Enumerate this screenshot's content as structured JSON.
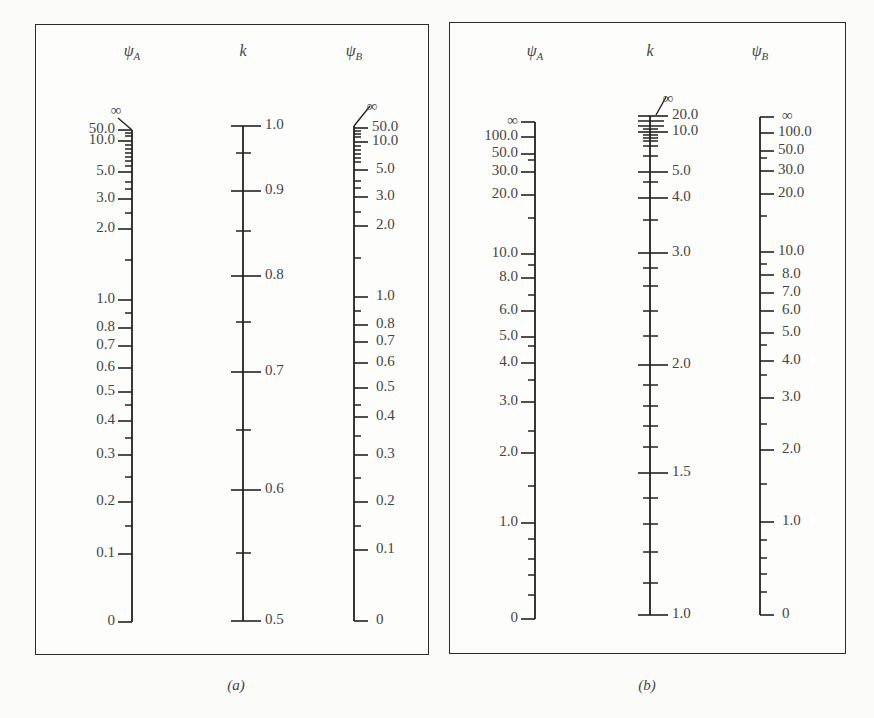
{
  "captions": {
    "a": "(a)",
    "b": "(b)"
  },
  "chart_data": [
    {
      "type": "nomograph",
      "title": "(a)",
      "axes": [
        {
          "name": "psi_A",
          "label": "ψ",
          "subscript": "A",
          "x": 132,
          "tick_side": "left",
          "label_side": "left",
          "top": 130,
          "bottom": 622,
          "infinity": {
            "label": "∞",
            "label_x": 116,
            "label_y": 112,
            "line": [
              118,
              118,
              132,
              130
            ]
          },
          "major": [
            {
              "v": "50.0",
              "y": 130
            },
            {
              "v": "10.0",
              "y": 141
            },
            {
              "v": "5.0",
              "y": 172
            },
            {
              "v": "3.0",
              "y": 199
            },
            {
              "v": "2.0",
              "y": 229
            },
            {
              "v": "1.0",
              "y": 300
            },
            {
              "v": "0.8",
              "y": 328
            },
            {
              "v": "0.7",
              "y": 346
            },
            {
              "v": "0.6",
              "y": 368
            },
            {
              "v": "0.5",
              "y": 392
            },
            {
              "v": "0.4",
              "y": 421
            },
            {
              "v": "0.3",
              "y": 455
            },
            {
              "v": "0.2",
              "y": 502
            },
            {
              "v": "0.1",
              "y": 554
            },
            {
              "v": "0",
              "y": 622
            }
          ],
          "minor": [
            133,
            136,
            145,
            149,
            153,
            157,
            161,
            166,
            182,
            189,
            213,
            260,
            313,
            405,
            438,
            477,
            526
          ]
        },
        {
          "name": "k",
          "label": "k",
          "subscript": "",
          "x": 243,
          "tick_side": "both",
          "label_side": "right",
          "top": 126,
          "bottom": 621,
          "major": [
            {
              "v": "1.0",
              "y": 126
            },
            {
              "v": "0.9",
              "y": 191
            },
            {
              "v": "0.8",
              "y": 276
            },
            {
              "v": "0.7",
              "y": 372
            },
            {
              "v": "0.6",
              "y": 490
            },
            {
              "v": "0.5",
              "y": 621
            }
          ],
          "minor": [
            153,
            231,
            322,
            430,
            553
          ]
        },
        {
          "name": "psi_B",
          "label": "ψ",
          "subscript": "B",
          "x": 354,
          "tick_side": "right",
          "label_side": "right",
          "top": 126,
          "bottom": 621,
          "infinity": {
            "label": "∞",
            "label_x": 372,
            "label_y": 108,
            "line": [
              370,
              106,
              354,
              126
            ]
          },
          "major": [
            {
              "v": "50.0",
              "y": 128
            },
            {
              "v": "10.0",
              "y": 142
            },
            {
              "v": "5.0",
              "y": 170
            },
            {
              "v": "3.0",
              "y": 197
            },
            {
              "v": "2.0",
              "y": 226
            },
            {
              "v": "1.0",
              "y": 297
            },
            {
              "v": "0.8",
              "y": 325
            },
            {
              "v": "0.7",
              "y": 342
            },
            {
              "v": "0.6",
              "y": 363
            },
            {
              "v": "0.5",
              "y": 388
            },
            {
              "v": "0.4",
              "y": 417
            },
            {
              "v": "0.3",
              "y": 455
            },
            {
              "v": "0.2",
              "y": 502
            },
            {
              "v": "0.1",
              "y": 550
            },
            {
              "v": "0",
              "y": 621
            }
          ],
          "minor": [
            131,
            134,
            137,
            146,
            150,
            154,
            158,
            162,
            181,
            188,
            212,
            258,
            311,
            405,
            436,
            478,
            526
          ]
        }
      ]
    },
    {
      "type": "nomograph",
      "title": "(b)",
      "axes": [
        {
          "name": "psi_A",
          "label": "ψ",
          "subscript": "A",
          "x": 535,
          "tick_side": "left",
          "label_side": "left",
          "top": 122,
          "bottom": 619,
          "major": [
            {
              "v": "∞",
              "y": 122
            },
            {
              "v": "100.0",
              "y": 137
            },
            {
              "v": "50.0",
              "y": 154
            },
            {
              "v": "30.0",
              "y": 172
            },
            {
              "v": "20.0",
              "y": 195
            },
            {
              "v": "10.0",
              "y": 254
            },
            {
              "v": "8.0",
              "y": 278
            },
            {
              "v": "6.0",
              "y": 311
            },
            {
              "v": "5.0",
              "y": 337
            },
            {
              "v": "4.0",
              "y": 363
            },
            {
              "v": "3.0",
              "y": 402
            },
            {
              "v": "2.0",
              "y": 453
            },
            {
              "v": "1.0",
              "y": 523
            },
            {
              "v": "0",
              "y": 619
            }
          ],
          "minor": [
            160,
            218,
            265,
            295,
            346,
            380,
            431,
            486,
            539,
            559,
            575,
            595
          ]
        },
        {
          "name": "k",
          "label": "k",
          "subscript": "",
          "x": 650,
          "tick_side": "both",
          "label_side": "right",
          "top": 116,
          "bottom": 615,
          "infinity": {
            "label": "∞",
            "label_x": 668,
            "label_y": 100,
            "line": [
              666,
              97,
              656,
              115
            ]
          },
          "major": [
            {
              "v": "20.0",
              "y": 116
            },
            {
              "v": "10.0",
              "y": 132
            },
            {
              "v": "5.0",
              "y": 172
            },
            {
              "v": "4.0",
              "y": 198
            },
            {
              "v": "3.0",
              "y": 253
            },
            {
              "v": "2.0",
              "y": 365
            },
            {
              "v": "1.5",
              "y": 473
            },
            {
              "v": "1.0",
              "y": 615
            }
          ],
          "minor_wide": [
            121,
            126
          ],
          "minor": [
            129,
            135,
            138,
            141,
            146,
            156,
            182,
            220,
            268,
            286,
            311,
            336,
            385,
            406,
            426,
            447,
            498,
            524,
            552,
            583
          ]
        },
        {
          "name": "psi_B",
          "label": "ψ",
          "subscript": "B",
          "x": 760,
          "tick_side": "right",
          "label_side": "right",
          "top": 117,
          "bottom": 615,
          "major": [
            {
              "v": "∞",
              "y": 117
            },
            {
              "v": "100.0",
              "y": 133
            },
            {
              "v": "50.0",
              "y": 151
            },
            {
              "v": "30.0",
              "y": 171
            },
            {
              "v": "20.0",
              "y": 194
            },
            {
              "v": "10.0",
              "y": 252
            },
            {
              "v": "8.0",
              "y": 275
            },
            {
              "v": "7.0",
              "y": 293
            },
            {
              "v": "6.0",
              "y": 311
            },
            {
              "v": "5.0",
              "y": 333
            },
            {
              "v": "4.0",
              "y": 361
            },
            {
              "v": "3.0",
              "y": 398
            },
            {
              "v": "2.0",
              "y": 450
            },
            {
              "v": "1.0",
              "y": 522
            },
            {
              "v": "0",
              "y": 615
            }
          ],
          "minor": [
            158,
            216,
            264,
            345,
            375,
            424,
            484,
            540,
            558,
            574,
            592
          ]
        }
      ]
    }
  ]
}
